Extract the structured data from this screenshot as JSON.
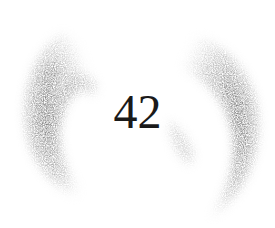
{
  "ornament": {
    "page_number": "42",
    "style": "grainy gray crescent brackets",
    "colors": {
      "background": "#ffffff",
      "number": "#1a1a1a",
      "crescent_dark": "#6e6e6e",
      "crescent_light": "#c8c8c8"
    },
    "icons": {
      "left": "left-crescent-icon",
      "right": "right-crescent-icon"
    }
  }
}
